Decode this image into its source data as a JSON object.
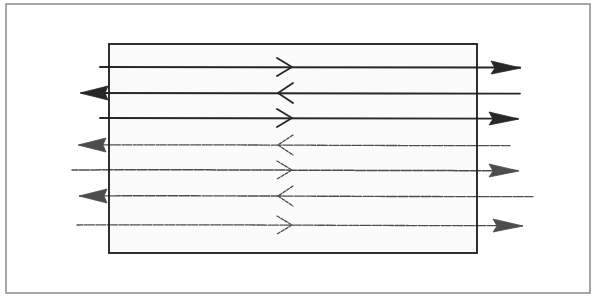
{
  "figure": {
    "width": 596,
    "height": 302,
    "background": "#ffffff",
    "outer_frame": {
      "x": 6,
      "y": 4,
      "width": 584,
      "height": 289,
      "stroke": "#8a8a8a",
      "stroke_width": 1.5
    },
    "inner_box": {
      "x": 109,
      "y": 44,
      "width": 368,
      "height": 209,
      "stroke": "#1a1a1a",
      "stroke_width": 1.8,
      "fill": "#fbfbfb"
    },
    "ink_color": "#1c1c1c",
    "middle_x": 285
  },
  "lines": [
    {
      "id": 1,
      "y": 67,
      "x_start": 100,
      "x_end": 520,
      "direction": "right",
      "head_x": 505,
      "chevron": "right",
      "weight": 2.0,
      "faint": false
    },
    {
      "id": 2,
      "y": 93,
      "x_start": 82,
      "x_end": 520,
      "direction": "left",
      "head_x": 96,
      "chevron": "left",
      "weight": 1.8,
      "faint": false
    },
    {
      "id": 3,
      "y": 118,
      "x_start": 100,
      "x_end": 517,
      "direction": "right",
      "head_x": 503,
      "chevron": "right",
      "weight": 1.9,
      "faint": false
    },
    {
      "id": 4,
      "y": 145,
      "x_start": 80,
      "x_end": 510,
      "direction": "left",
      "head_x": 94,
      "chevron": "left",
      "weight": 1.3,
      "faint": true
    },
    {
      "id": 5,
      "y": 170,
      "x_start": 72,
      "x_end": 517,
      "direction": "right",
      "head_x": 503,
      "chevron": "right",
      "weight": 1.5,
      "faint": true
    },
    {
      "id": 6,
      "y": 196,
      "x_start": 80,
      "x_end": 533,
      "direction": "left",
      "head_x": 95,
      "chevron": "left",
      "weight": 1.4,
      "faint": true
    },
    {
      "id": 7,
      "y": 225,
      "x_start": 77,
      "x_end": 522,
      "direction": "right",
      "head_x": 507,
      "chevron": "right",
      "weight": 1.3,
      "faint": true
    }
  ]
}
